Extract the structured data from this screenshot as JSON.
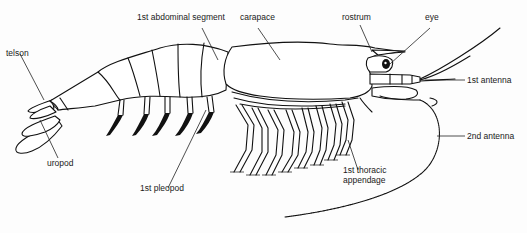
{
  "diagram": {
    "labels": {
      "telson": "telson",
      "first_abdominal_segment": "1st abdominal segment",
      "carapace": "carapace",
      "rostrum": "rostrum",
      "eye": "eye",
      "first_antenna": "1st antenna",
      "second_antenna": "2nd antenna",
      "first_thoracic_appendage_line1": "1st thoracic",
      "first_thoracic_appendage_line2": "appendage",
      "first_pleopod": "1st pleopod",
      "uropod": "uropod"
    },
    "colors": {
      "line": "#111111",
      "background": "#fdfdfd"
    }
  }
}
